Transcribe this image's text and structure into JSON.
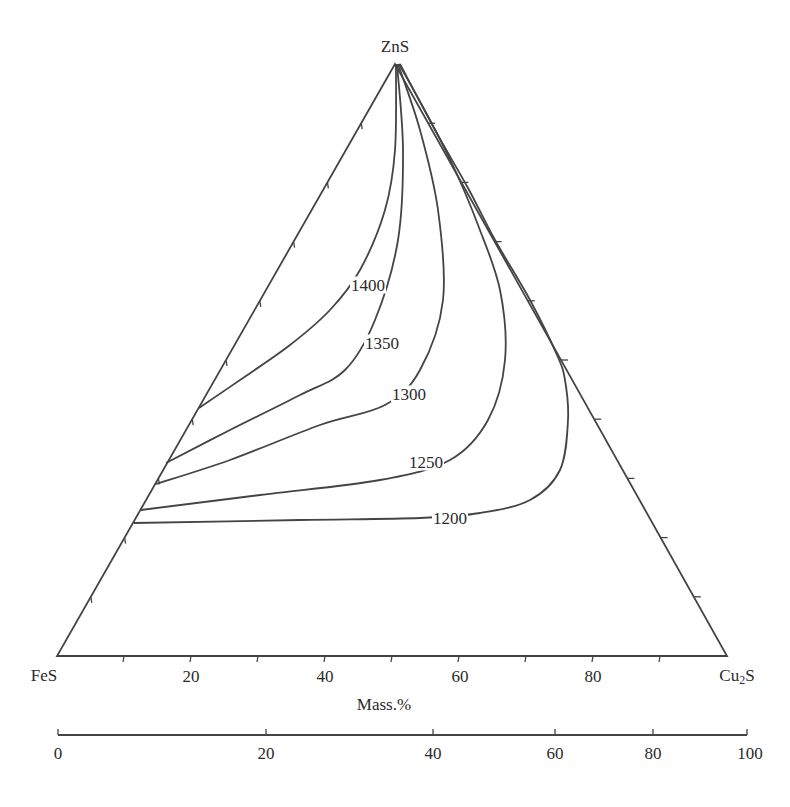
{
  "chart_data": {
    "type": "ternary-contour",
    "title": "",
    "vertices": {
      "top": {
        "label": "ZnS",
        "x": 395,
        "y": 64
      },
      "left": {
        "label": "FeS",
        "x": 57,
        "y": 656
      },
      "right": {
        "label": "Cu2S",
        "label_main": "Cu",
        "label_sub": "2",
        "label_tail": "S",
        "x": 727,
        "y": 656
      }
    },
    "bottom_axis": {
      "label": "Mass.%",
      "ticks": [
        20,
        40,
        60,
        80
      ],
      "tick_count_between_vertices": 10
    },
    "secondary_scale": {
      "ticks": [
        0,
        20,
        40,
        60,
        80,
        100
      ],
      "tick_x": [
        58,
        266,
        433,
        555,
        653,
        747
      ],
      "y": 735
    },
    "isotherms_unit": "°C",
    "isotherms": [
      {
        "label": "1400",
        "label_pos": [
          368,
          285
        ],
        "points": [
          [
            199,
            408
          ],
          [
            240,
            380
          ],
          [
            290,
            345
          ],
          [
            330,
            310
          ],
          [
            360,
            270
          ],
          [
            385,
            210
          ],
          [
            395,
            150
          ],
          [
            396,
            64
          ]
        ]
      },
      {
        "label": "1350",
        "label_pos": [
          382,
          343
        ],
        "points": [
          [
            166,
            463
          ],
          [
            230,
            430
          ],
          [
            300,
            395
          ],
          [
            345,
            370
          ],
          [
            375,
            320
          ],
          [
            398,
            240
          ],
          [
            403,
            150
          ],
          [
            397,
            64
          ]
        ]
      },
      {
        "label": "1300",
        "label_pos": [
          409,
          394
        ],
        "points": [
          [
            156,
            484
          ],
          [
            230,
            460
          ],
          [
            320,
            425
          ],
          [
            385,
            405
          ],
          [
            420,
            370
          ],
          [
            443,
            300
          ],
          [
            438,
            210
          ],
          [
            420,
            130
          ],
          [
            398,
            64
          ]
        ]
      },
      {
        "label": "1250",
        "label_pos": [
          426,
          462
        ],
        "points": [
          [
            141,
            510
          ],
          [
            260,
            495
          ],
          [
            380,
            480
          ],
          [
            450,
            460
          ],
          [
            488,
            420
          ],
          [
            505,
            360
          ],
          [
            500,
            290
          ],
          [
            478,
            225
          ],
          [
            455,
            170
          ],
          [
            430,
            120
          ],
          [
            399,
            64
          ]
        ]
      },
      {
        "label": "1200",
        "label_pos": [
          450,
          518
        ],
        "points": [
          [
            134,
            523
          ],
          [
            300,
            520
          ],
          [
            420,
            518
          ],
          [
            480,
            513
          ],
          [
            530,
            500
          ],
          [
            560,
            470
          ],
          [
            568,
            420
          ],
          [
            565,
            380
          ],
          [
            557,
            355
          ],
          [
            530,
            300
          ],
          [
            495,
            240
          ],
          [
            468,
            188
          ],
          [
            435,
            130
          ],
          [
            400,
            64
          ]
        ]
      }
    ],
    "left_edge_ticks": 9,
    "right_edge_ticks": 9
  },
  "colors": {
    "line": "#444444",
    "text": "#2a2a2a",
    "background": "#ffffff"
  }
}
